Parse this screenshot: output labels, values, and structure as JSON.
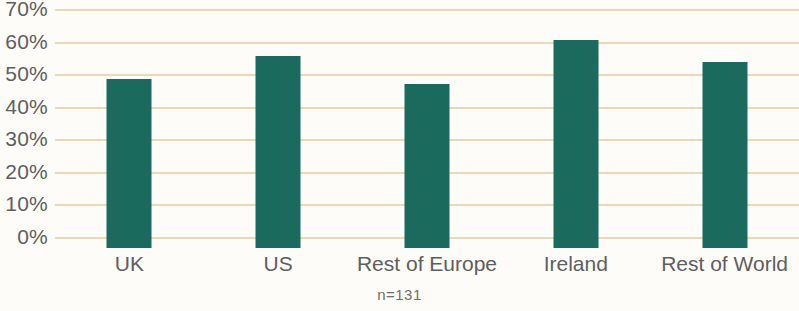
{
  "chart_data": {
    "type": "bar",
    "title": "",
    "subtitle": "",
    "xlabel": "",
    "ylabel": "",
    "categories": [
      "UK",
      "US",
      "Rest of Europe",
      "Ireland",
      "Rest of World"
    ],
    "values": [
      52,
      59,
      50.5,
      64,
      57
    ],
    "value_labels": [
      "52%",
      "59%",
      "50.5%",
      "64%",
      "57%"
    ],
    "ylim": [
      0,
      70
    ],
    "ytick_values": [
      0,
      10,
      20,
      30,
      40,
      50,
      60,
      70
    ],
    "ytick_labels": [
      "0%",
      "10%",
      "20%",
      "30%",
      "40%",
      "50%",
      "60%",
      "70%"
    ],
    "grid": true,
    "grid_axis": "y",
    "legend": false,
    "legend_position": "none",
    "annotation": "n=131",
    "series": [
      {
        "name": "Share",
        "values": [
          52,
          59,
          50.5,
          64,
          57
        ]
      }
    ]
  },
  "colors": {
    "bar": "#1a6b5d",
    "gridline": "#ead9b4",
    "text": "#5d5e60",
    "annotation_text": "#6d6e70",
    "background": "#fdfcf8"
  }
}
